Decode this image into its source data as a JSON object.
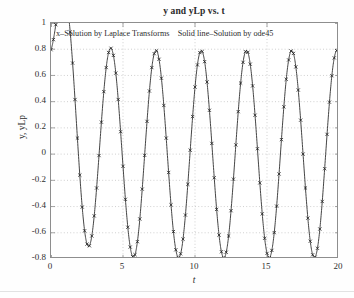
{
  "figure": {
    "title": "y and yLp vs. t",
    "legend_note": "x–Solution by Laplace Transforms    Solid line–Solution by ode45",
    "xlabel": "t",
    "ylabel": "y, yLp"
  },
  "axes": {
    "xticks": [
      "0",
      "5",
      "10",
      "15",
      "20"
    ],
    "yticks": [
      "1",
      "0.8",
      "0.6",
      "0.4",
      "0.2",
      "0",
      "-0.2",
      "-0.4",
      "-0.6",
      "-0.8"
    ]
  },
  "colors": {
    "line": "#3a3a3a",
    "marker": "#1f1f1f",
    "grid": "#bcbcbc",
    "axis": "#8e8e8e",
    "text": "#2f2f2f",
    "background": "#ffffff"
  },
  "chart_data": {
    "type": "line",
    "title": "y and yLp vs. t",
    "xlabel": "t",
    "ylabel": "y, yLp",
    "xlim": [
      0,
      20
    ],
    "ylim": [
      -0.8,
      1
    ],
    "grid": true,
    "legend_position": "top-inside",
    "series": [
      {
        "name": "Solid line–Solution by ode45",
        "style": "solid-line",
        "color": "#3a3a3a"
      },
      {
        "name": "x–Solution by Laplace Transforms",
        "style": "x-markers",
        "color": "#1f1f1f"
      }
    ],
    "model": {
      "description": "Damped transient plus steady-state sinusoid; amplitude 0.79, angular frequency 2 rad/s (period pi), transient decay constant 1.0",
      "formula": "y(t) = 0.79*sin(2*t - 0.45) + 1.14*exp(-1.0*t)",
      "amplitude": 0.79,
      "omega": 2.0,
      "phase": -0.45,
      "transient_amplitude": 1.14,
      "decay": 1.0,
      "marker_count": 121,
      "marker_spacing_t": 0.1667
    },
    "x": [
      0,
      0.55,
      1.7,
      3.3,
      4.8,
      6.45,
      7.95,
      9.6,
      11.1,
      12.75,
      14.25,
      15.9,
      17.4,
      19.0,
      20.0
    ],
    "y": [
      0.8,
      0.02,
      0.85,
      -0.79,
      0.79,
      -0.79,
      0.79,
      -0.79,
      0.79,
      -0.79,
      0.79,
      -0.79,
      0.79,
      -0.79,
      0.33
    ],
    "key_points": [
      {
        "label": "start",
        "t": 0,
        "y": 0.8
      },
      {
        "label": "first-min",
        "t": 0.55,
        "y": 0.02
      },
      {
        "label": "first-peak",
        "t": 1.7,
        "y": 0.85
      },
      {
        "label": "steady-peak",
        "t": 4.8,
        "y": 0.79
      },
      {
        "label": "steady-trough",
        "t": 3.3,
        "y": -0.79
      },
      {
        "label": "end",
        "t": 20,
        "y": 0.33
      }
    ]
  }
}
